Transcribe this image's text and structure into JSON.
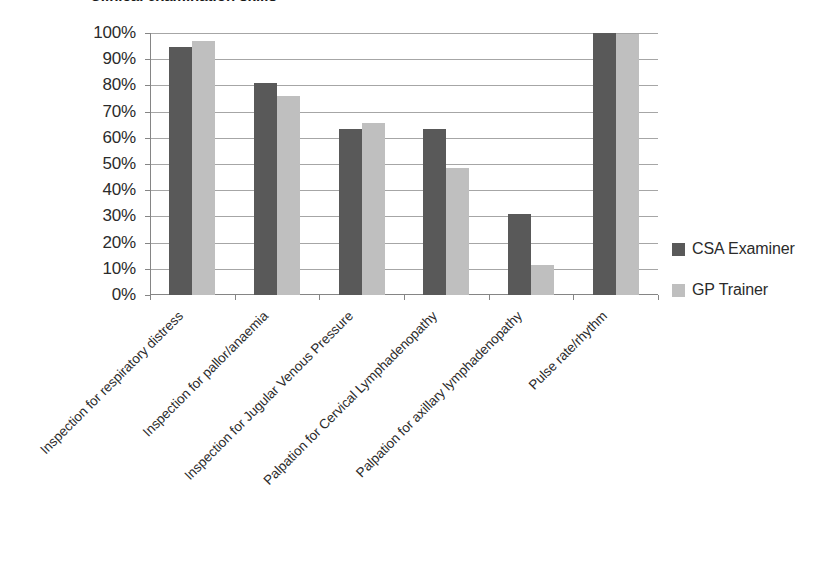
{
  "chart_data": {
    "type": "bar",
    "title": "",
    "xlabel": "",
    "ylabel": "",
    "ylim": [
      0,
      100
    ],
    "ytick_labels": [
      "100%",
      "90%",
      "80%",
      "70%",
      "60%",
      "50%",
      "40%",
      "30%",
      "20%",
      "10%",
      "0%"
    ],
    "ytick_values": [
      100,
      90,
      80,
      70,
      60,
      50,
      40,
      30,
      20,
      10,
      0
    ],
    "grid": true,
    "legend_position": "right",
    "categories": [
      "Inspection for respiratory distress",
      "Inspection for pallor/anaemia",
      "Inspection for Jugular Venous Pressure",
      "Palpation for Cervical Lymphadenopathy",
      "Palpation for axillary lymphadenopathy",
      "Pulse rate/rhythm"
    ],
    "series": [
      {
        "name": "CSA Examiner",
        "color": "#595959",
        "values": [
          94.5,
          81,
          63.5,
          63.5,
          31,
          100
        ]
      },
      {
        "name": "GP Trainer",
        "color": "#bfbfbf",
        "values": [
          97,
          76,
          65.5,
          48.5,
          11.5,
          99.5
        ]
      }
    ]
  },
  "legend": {
    "items": [
      {
        "label": "CSA Examiner",
        "swatch": "#595959"
      },
      {
        "label": "GP Trainer",
        "swatch": "#bfbfbf"
      }
    ]
  },
  "title_fragment": "Clinical examination skills"
}
